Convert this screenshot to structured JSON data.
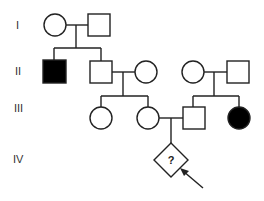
{
  "diagram": {
    "type": "pedigree",
    "generations": [
      "I",
      "II",
      "III",
      "IV"
    ],
    "colors": {
      "affected": "#000000",
      "unaffected": "#ffffff",
      "line": "#222222"
    },
    "individuals": [
      {
        "id": "I-1",
        "generation": "I",
        "sex": "female",
        "affected": false
      },
      {
        "id": "I-2",
        "generation": "I",
        "sex": "male",
        "affected": false
      },
      {
        "id": "II-1",
        "generation": "II",
        "sex": "male",
        "affected": true
      },
      {
        "id": "II-2",
        "generation": "II",
        "sex": "male",
        "affected": false
      },
      {
        "id": "II-3",
        "generation": "II",
        "sex": "female",
        "affected": false
      },
      {
        "id": "II-4",
        "generation": "II",
        "sex": "female",
        "affected": false
      },
      {
        "id": "II-5",
        "generation": "II",
        "sex": "male",
        "affected": false
      },
      {
        "id": "III-1",
        "generation": "III",
        "sex": "female",
        "affected": false
      },
      {
        "id": "III-2",
        "generation": "III",
        "sex": "female",
        "affected": false
      },
      {
        "id": "III-3",
        "generation": "III",
        "sex": "male",
        "affected": false
      },
      {
        "id": "III-4",
        "generation": "III",
        "sex": "female",
        "affected": true
      },
      {
        "id": "IV-1",
        "generation": "IV",
        "sex": "unknown",
        "affected": null,
        "label": "?",
        "proband": true
      }
    ],
    "matings": [
      {
        "partners": [
          "I-1",
          "I-2"
        ],
        "children": [
          "II-1",
          "II-2"
        ]
      },
      {
        "partners": [
          "II-2",
          "II-3"
        ],
        "children": [
          "III-1",
          "III-2"
        ]
      },
      {
        "partners": [
          "II-4",
          "II-5"
        ],
        "children": [
          "III-3",
          "III-4"
        ]
      },
      {
        "partners": [
          "III-2",
          "III-3"
        ],
        "children": [
          "IV-1"
        ]
      }
    ],
    "unknown_label": "?",
    "proband_marker": "arrow"
  }
}
